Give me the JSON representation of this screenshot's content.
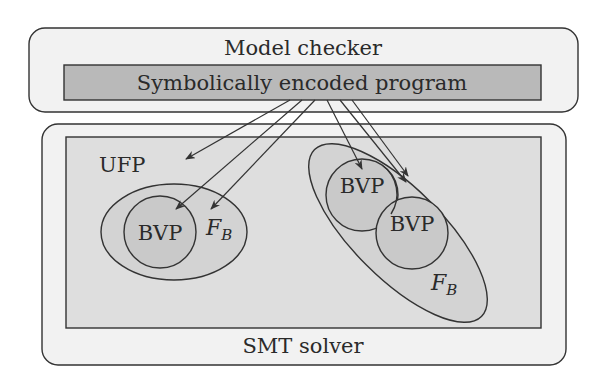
{
  "diagram": {
    "model_checker": {
      "label": "Model checker"
    },
    "program": {
      "label": "Symbolically encoded program"
    },
    "smt_solver": {
      "label": "SMT solver"
    },
    "ufp": {
      "label": "UFP"
    },
    "left_group": {
      "bvp_label": "BVP",
      "fb_label": "F",
      "fb_sub": "B"
    },
    "right_group": {
      "bvp1_label": "BVP",
      "bvp2_label": "BVP",
      "fb_label": "F",
      "fb_sub": "B"
    },
    "arrows": [
      {
        "from": "program",
        "to": "ufp"
      },
      {
        "from": "program",
        "to": "left-bvp"
      },
      {
        "from": "program",
        "to": "left-fb"
      },
      {
        "from": "program",
        "to": "right-bvp-1"
      },
      {
        "from": "program",
        "to": "right-fb"
      },
      {
        "from": "program",
        "to": "right-bvp-2"
      }
    ]
  },
  "colors": {
    "outer_box": "#f2f2f2",
    "program_bar": "#b9b9b9",
    "ufp_region": "#dedede",
    "fb_ellipse": "#d3d3d3",
    "bvp_circle": "#c9c9c9",
    "stroke": "#333333"
  }
}
